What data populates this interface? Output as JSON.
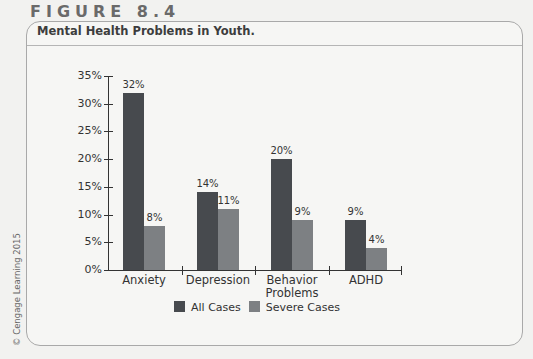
{
  "figure": {
    "label": "FIGURE 8.4",
    "title": "Mental Health Problems in Youth.",
    "credit": "© Cengage Learning 2015"
  },
  "colors": {
    "all_cases": "#474a4e",
    "severe_cases": "#7d8083"
  },
  "legend": {
    "all": "All Cases",
    "severe": "Severe Cases"
  },
  "y_ticks": [
    "0%",
    "5%",
    "10%",
    "15%",
    "20%",
    "25%",
    "30%",
    "35%"
  ],
  "categories": [
    "Anxiety",
    "Depression",
    "Behavior Problems",
    "ADHD"
  ],
  "value_labels": {
    "all": [
      "32%",
      "14%",
      "20%",
      "9%"
    ],
    "severe": [
      "8%",
      "11%",
      "9%",
      "4%"
    ]
  },
  "chart_data": {
    "type": "bar",
    "title": "Mental Health Problems in Youth.",
    "categories": [
      "Anxiety",
      "Depression",
      "Behavior Problems",
      "ADHD"
    ],
    "series": [
      {
        "name": "All Cases",
        "values": [
          32,
          14,
          20,
          9
        ]
      },
      {
        "name": "Severe Cases",
        "values": [
          8,
          11,
          9,
          4
        ]
      }
    ],
    "xlabel": "",
    "ylabel": "",
    "ylim": [
      0,
      35
    ],
    "yticks": [
      0,
      5,
      10,
      15,
      20,
      25,
      30,
      35
    ],
    "tick_format": "percent",
    "grid": false,
    "legend_position": "bottom"
  }
}
